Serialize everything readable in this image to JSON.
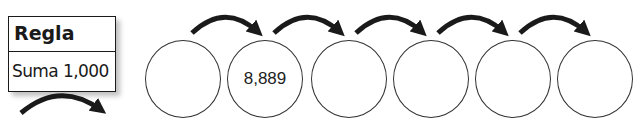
{
  "rule": {
    "title": "Regla",
    "value": "Suma 1,000"
  },
  "sequence": [
    {
      "value": ""
    },
    {
      "value": "8,889"
    },
    {
      "value": ""
    },
    {
      "value": ""
    },
    {
      "value": ""
    },
    {
      "value": ""
    }
  ],
  "colors": {
    "stroke": "#1a1a1a",
    "circle_border": "#333333"
  }
}
